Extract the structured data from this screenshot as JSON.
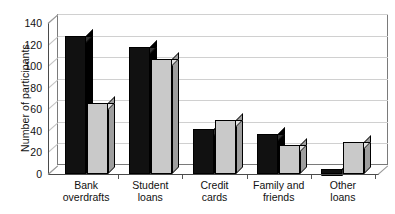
{
  "chart_data": {
    "type": "bar",
    "title": "",
    "subtitle": "",
    "xlabel": "",
    "ylabel": "Number of participants",
    "ylim": [
      0,
      140
    ],
    "ytick_step": 20,
    "yticks": [
      140,
      120,
      100,
      80,
      60,
      40,
      20,
      0
    ],
    "ytick_labels": [
      "140",
      "120",
      "100",
      "80",
      "60",
      "40",
      "20",
      "0"
    ],
    "grid": true,
    "legend": "none",
    "three_d": true,
    "categories": [
      "Bank overdrafts",
      "Student loans",
      "Credit cards",
      "Family and friends",
      "Other loans"
    ],
    "category_lines": [
      [
        "Bank",
        "overdrafts"
      ],
      [
        "Student",
        "loans"
      ],
      [
        "Credit",
        "cards"
      ],
      [
        "Family and",
        "friends"
      ],
      [
        "Other",
        "loans"
      ]
    ],
    "series": [
      {
        "name": "Series 1",
        "color": "#111111",
        "values": [
          128,
          118,
          42,
          37,
          5
        ]
      },
      {
        "name": "Series 2",
        "color": "#c9c9c9",
        "values": [
          66,
          107,
          50,
          27,
          30
        ]
      }
    ]
  },
  "axes": {
    "y_title": "Number of participants"
  }
}
